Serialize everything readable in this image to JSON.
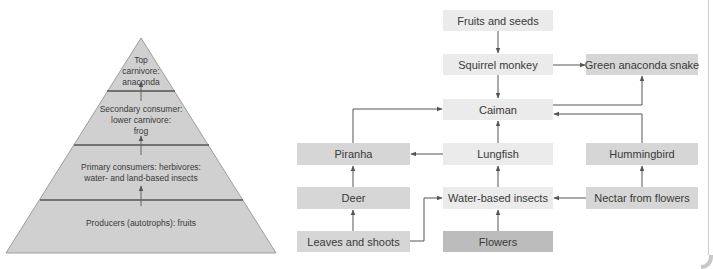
{
  "pyramid": {
    "levels": [
      {
        "id": "top",
        "label_lines": [
          "Top",
          "carnivore:",
          "anaconda"
        ]
      },
      {
        "id": "secondary",
        "label_lines": [
          "Secondary consumer:",
          "lower carnivore:",
          "frog"
        ]
      },
      {
        "id": "primary",
        "label_lines": [
          "Primary consumers: herbivores:",
          "water- and land-based insects"
        ]
      },
      {
        "id": "producers",
        "label_lines": [
          "Producers (autotrophs): fruits"
        ]
      }
    ]
  },
  "food_web": {
    "nodes": {
      "fruits": "Fruits and seeds",
      "squirrel": "Squirrel monkey",
      "anaconda": "Green anaconda snake",
      "caiman": "Caiman",
      "piranha": "Piranha",
      "lungfish": "Lungfish",
      "hummingbird": "Hummingbird",
      "deer": "Deer",
      "insects": "Water-based insects",
      "nectar": "Nectar from flowers",
      "leaves": "Leaves and shoots",
      "flowers": "Flowers"
    },
    "edges": [
      [
        "fruits",
        "squirrel"
      ],
      [
        "squirrel",
        "caiman"
      ],
      [
        "squirrel",
        "anaconda"
      ],
      [
        "caiman",
        "anaconda"
      ],
      [
        "hummingbird",
        "caiman"
      ],
      [
        "piranha",
        "caiman"
      ],
      [
        "lungfish",
        "caiman"
      ],
      [
        "lungfish",
        "piranha"
      ],
      [
        "deer",
        "piranha"
      ],
      [
        "insects",
        "lungfish"
      ],
      [
        "nectar",
        "hummingbird"
      ],
      [
        "nectar",
        "insects"
      ],
      [
        "leaves",
        "deer"
      ],
      [
        "leaves",
        "insects"
      ],
      [
        "flowers",
        "insects"
      ]
    ]
  }
}
